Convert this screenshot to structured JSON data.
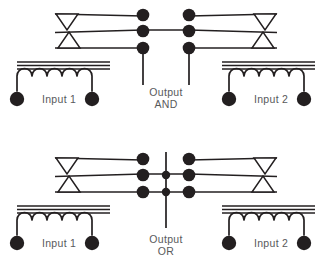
{
  "figure": {
    "background_color": "#ffffff",
    "ink_color": "#231f20",
    "text_color": "#58595b",
    "width": 332,
    "height": 274
  },
  "gates": [
    {
      "id": "and-gate",
      "output_label_line1": "Output",
      "output_label_line2": "AND",
      "input_left_label": "Input 1",
      "input_right_label": "Input 2",
      "contact_topology": "series",
      "description": "Two relays with normally-open contacts wired in series; output is energized only when both Input 1 and Input 2 coils are energized.",
      "center_bus": false
    },
    {
      "id": "or-gate",
      "output_label_line1": "Output",
      "output_label_line2": "OR",
      "input_left_label": "Input 1",
      "input_right_label": "Input 2",
      "contact_topology": "parallel",
      "description": "Two relays with normally-open contacts wired in parallel onto a common output bus; output is energized when either Input 1 or Input 2 coil is energized.",
      "center_bus": true
    }
  ],
  "symbols": {
    "coil_arcs": 5,
    "core_lines": 3,
    "armature_triangle_down": "inverted-triangle",
    "armature_triangle_up": "upright-triangle",
    "contact_node": "filled-circle",
    "terminal_node": "filled-circle"
  }
}
